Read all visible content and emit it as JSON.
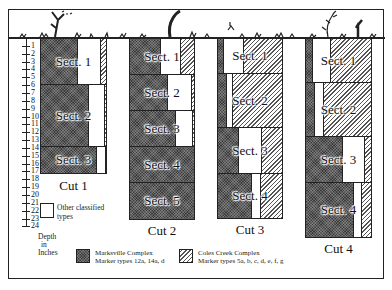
{
  "figure": {
    "depth_axis": {
      "label_lines": [
        "Depth",
        "in",
        "Inches"
      ],
      "ticks": [
        "1",
        "2",
        "3",
        "4",
        "5",
        "6",
        "7",
        "8",
        "9",
        "10",
        "11",
        "12",
        "13",
        "14",
        "15",
        "16",
        "17",
        "18",
        "19",
        "20",
        "21",
        "22",
        "23",
        "24"
      ]
    },
    "cuts": [
      {
        "label": "Cut 1",
        "sections": [
          {
            "label": "Sect. 1",
            "depth_from": 0,
            "depth_to": 5,
            "marksville": 0.56,
            "other": 0.36,
            "coles_creek": 0.08
          },
          {
            "label": "Sect. 2",
            "depth_from": 5,
            "depth_to": 12,
            "marksville": 0.73,
            "other": 0.25,
            "coles_creek": 0.02
          },
          {
            "label": "Sect. 3",
            "depth_from": 12,
            "depth_to": 15,
            "marksville": 0.85,
            "other": 0.15,
            "coles_creek": 0.0
          }
        ]
      },
      {
        "label": "Cut 2",
        "sections": [
          {
            "label": "Sect. 1",
            "depth_from": 0,
            "depth_to": 4,
            "marksville": 0.47,
            "other": 0.32,
            "coles_creek": 0.21
          },
          {
            "label": "Sect. 2",
            "depth_from": 4,
            "depth_to": 8,
            "marksville": 0.58,
            "other": 0.39,
            "coles_creek": 0.03
          },
          {
            "label": "Sect. 3",
            "depth_from": 8,
            "depth_to": 12,
            "marksville": 0.7,
            "other": 0.29,
            "coles_creek": 0.01
          },
          {
            "label": "Sect. 4",
            "depth_from": 12,
            "depth_to": 16,
            "marksville": 1.0,
            "other": 0.0,
            "coles_creek": 0.0
          },
          {
            "label": "Sect. 5",
            "depth_from": 16,
            "depth_to": 20,
            "marksville": 1.0,
            "other": 0.0,
            "coles_creek": 0.0
          }
        ]
      },
      {
        "label": "Cut 3",
        "sections": [
          {
            "label": "Sect. 1",
            "depth_from": 0,
            "depth_to": 4,
            "marksville": 0.08,
            "other": 0.33,
            "coles_creek": 0.59
          },
          {
            "label": "Sect. 2",
            "depth_from": 4,
            "depth_to": 10,
            "marksville": 0.12,
            "other": 0.11,
            "coles_creek": 0.77
          },
          {
            "label": "Sect. 3",
            "depth_from": 10,
            "depth_to": 15,
            "marksville": 0.32,
            "other": 0.36,
            "coles_creek": 0.32
          },
          {
            "label": "Sect. 4",
            "depth_from": 15,
            "depth_to": 20,
            "marksville": 0.52,
            "other": 0.15,
            "coles_creek": 0.33
          }
        ]
      },
      {
        "label": "Cut 4",
        "sections": [
          {
            "label": "Sect. 1",
            "depth_from": 0,
            "depth_to": 5,
            "marksville": 0.09,
            "other": 0.3,
            "coles_creek": 0.61
          },
          {
            "label": "Sect. 2",
            "depth_from": 5,
            "depth_to": 11,
            "marksville": 0.12,
            "other": 0.16,
            "coles_creek": 0.72
          },
          {
            "label": "Sect. 3",
            "depth_from": 11,
            "depth_to": 16,
            "marksville": 0.55,
            "other": 0.36,
            "coles_creek": 0.09
          },
          {
            "label": "Sect. 4",
            "depth_from": 16,
            "depth_to": 22,
            "marksville": 0.73,
            "other": 0.13,
            "coles_creek": 0.14
          }
        ]
      }
    ],
    "legend": {
      "other": {
        "line1": "Other classified",
        "line2": "types"
      },
      "marksville": {
        "line1": "Marksville Complex",
        "line2": "Marker types 12a, 14a, d"
      },
      "coles_creek": {
        "line1": "Coles Creek Complex",
        "line2": "Marker types 5a, b, c, d, e, f, g"
      }
    }
  }
}
